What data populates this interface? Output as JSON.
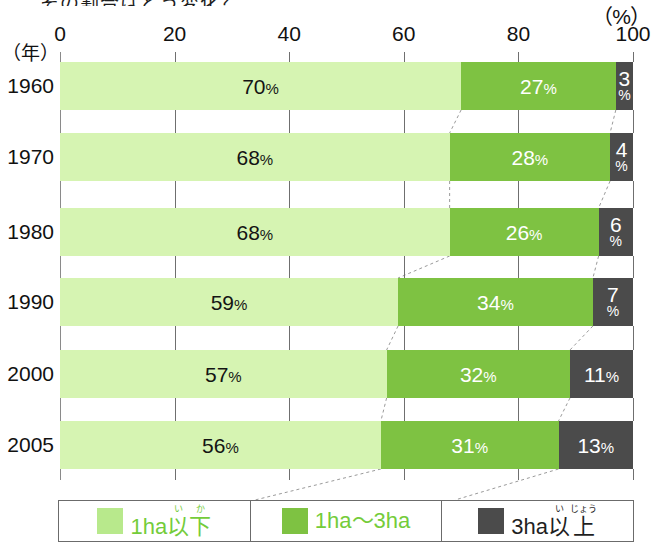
{
  "heading_cropped": "その割合はどう変化？",
  "axis": {
    "x_unit": "（%）",
    "y_unit": "（年）",
    "x_ticks": [
      "0",
      "20",
      "40",
      "60",
      "80",
      "100"
    ]
  },
  "legend": {
    "items": [
      {
        "name": "1ha-or-less",
        "color": "#b8e98c",
        "base": "1ha以",
        "kanji_ruby": [
          {
            "base": "以",
            "rt": "い"
          },
          {
            "base": "下",
            "rt": "か"
          }
        ],
        "prefix": "1ha",
        "text_color": "#74cc3a"
      },
      {
        "name": "1ha-to-3ha",
        "color": "#7ec242",
        "label": "1ha〜3ha",
        "text_color": "#74cc3a"
      },
      {
        "name": "3ha-or-more",
        "color": "#4b4b4b",
        "prefix": "3ha",
        "kanji_ruby": [
          {
            "base": "以",
            "rt": "い"
          },
          {
            "base": "上",
            "rt": "じょう"
          }
        ],
        "text_color": "#1f1f1f"
      }
    ]
  },
  "chart_data": {
    "type": "bar",
    "orientation": "horizontal",
    "stacked": true,
    "title": "",
    "xlabel": "（%）",
    "ylabel": "（年）",
    "xlim": [
      0,
      100
    ],
    "grid": false,
    "categories": [
      "1960",
      "1970",
      "1980",
      "1990",
      "2000",
      "2005"
    ],
    "series": [
      {
        "name": "1ha以下",
        "color": "#d6f4b2",
        "label_color": "#141414",
        "values": [
          70,
          68,
          68,
          59,
          57,
          56
        ]
      },
      {
        "name": "1ha〜3ha",
        "color": "#7ec242",
        "label_color": "#ffffff",
        "values": [
          27,
          28,
          26,
          34,
          32,
          31
        ]
      },
      {
        "name": "3ha以上",
        "color": "#4b4b4b",
        "label_color": "#ffffff",
        "values": [
          3,
          4,
          6,
          7,
          11,
          13
        ]
      }
    ],
    "data_labels": [
      [
        "70%",
        "27%",
        "3%"
      ],
      [
        "68%",
        "28%",
        "4%"
      ],
      [
        "68%",
        "26%",
        "6%"
      ],
      [
        "59%",
        "34%",
        "7%"
      ],
      [
        "57%",
        "32%",
        "11%"
      ],
      [
        "56%",
        "31%",
        "13%"
      ]
    ],
    "legend_position": "bottom"
  }
}
